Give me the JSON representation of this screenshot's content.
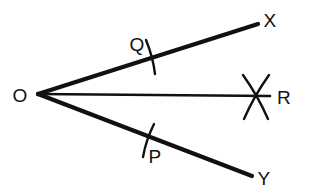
{
  "figure": {
    "kind": "geometry-diagram",
    "background_color": "#ffffff",
    "stroke_color": "#111111",
    "width": 310,
    "height": 196,
    "points": [
      {
        "name": "O",
        "label": "O",
        "x": 38,
        "y": 94,
        "label_x": 20,
        "label_y": 95,
        "role": "vertex"
      },
      {
        "name": "X",
        "label": "X",
        "x": 258,
        "y": 24,
        "label_x": 270,
        "label_y": 20,
        "role": "ray-endpoint"
      },
      {
        "name": "R",
        "label": "R",
        "x": 270,
        "y": 96,
        "label_x": 284,
        "label_y": 97,
        "role": "bisector-endpoint"
      },
      {
        "name": "Y",
        "label": "Y",
        "x": 252,
        "y": 176,
        "label_x": 264,
        "label_y": 178,
        "role": "ray-endpoint"
      },
      {
        "name": "Q",
        "label": "Q",
        "x": 150,
        "y": 57,
        "label_x": 137,
        "label_y": 44,
        "role": "arc-mark-point"
      },
      {
        "name": "P",
        "label": "P",
        "x": 148,
        "y": 140,
        "label_x": 155,
        "label_y": 156,
        "role": "arc-mark-point"
      }
    ],
    "rays": [
      {
        "name": "ray-OX",
        "from": "O",
        "to": "X",
        "x1": 38,
        "y1": 94,
        "x2": 258,
        "y2": 24,
        "stroke_width": 4.2
      },
      {
        "name": "ray-OR",
        "from": "O",
        "to": "R",
        "x1": 38,
        "y1": 94,
        "x2": 270,
        "y2": 96,
        "stroke_width": 2.6
      },
      {
        "name": "ray-OY",
        "from": "O",
        "to": "Y",
        "x1": 38,
        "y1": 94,
        "x2": 252,
        "y2": 176,
        "stroke_width": 4.2
      }
    ],
    "arc_marks": [
      {
        "name": "arc-mark-Q",
        "at": "Q",
        "x1": 146,
        "y1": 40,
        "x2": 155,
        "y2": 74,
        "stroke_width": 2.4
      },
      {
        "name": "arc-mark-P",
        "at": "P",
        "x1": 154,
        "y1": 124,
        "x2": 143,
        "y2": 157,
        "stroke_width": 2.4
      }
    ],
    "crossed_arcs": {
      "name": "crossed-arcs-R",
      "at": "R",
      "center_x": 256,
      "center_y": 96,
      "strokes": [
        {
          "x1": 243,
          "y1": 75,
          "x2": 268,
          "y2": 119
        },
        {
          "x1": 269,
          "y1": 75,
          "x2": 244,
          "y2": 119
        }
      ],
      "stroke_width": 2.4
    }
  }
}
